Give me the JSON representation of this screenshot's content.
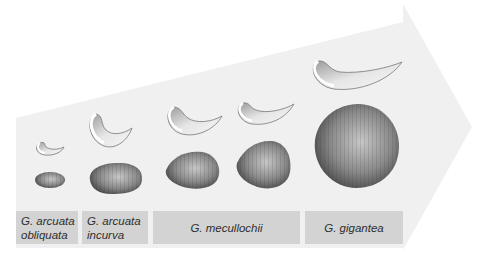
{
  "figure": {
    "type": "evolutionary size progression arrow",
    "colors": {
      "arrow_fill": "#f0f0f0",
      "label_fill": "#d3d3d3",
      "label_text": "#2e2e2e",
      "shell_dark": "#555555",
      "shell_light": "#bdbdbd"
    }
  },
  "species": [
    {
      "line1": "G. arcuata",
      "line2": "obliquata"
    },
    {
      "line1": "G. arcuata",
      "line2": "incurva"
    },
    {
      "line1": "G. mecullochii",
      "line2": ""
    },
    {
      "line1": "G. gigantea",
      "line2": ""
    }
  ]
}
